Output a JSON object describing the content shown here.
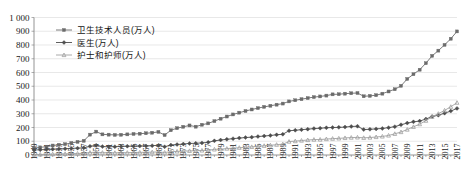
{
  "chart_data": {
    "type": "line",
    "title": "",
    "subtitle": "",
    "xlabel": "",
    "ylabel": "",
    "xlim": [
      1949,
      2017
    ],
    "ylim": [
      0,
      1000
    ],
    "ytick_step": 100,
    "xtick_step": 2,
    "grid": true,
    "legend_position": "top-left",
    "ytick_labels": [
      "0",
      "100",
      "200",
      "300",
      "400",
      "500",
      "600",
      "700",
      "800",
      "900",
      "1 000"
    ],
    "x": [
      1949,
      1950,
      1951,
      1952,
      1953,
      1954,
      1955,
      1956,
      1957,
      1958,
      1959,
      1960,
      1961,
      1962,
      1963,
      1964,
      1965,
      1966,
      1967,
      1968,
      1969,
      1970,
      1971,
      1972,
      1973,
      1974,
      1975,
      1976,
      1977,
      1978,
      1979,
      1980,
      1981,
      1982,
      1983,
      1984,
      1985,
      1986,
      1987,
      1988,
      1989,
      1990,
      1991,
      1992,
      1993,
      1994,
      1995,
      1996,
      1997,
      1998,
      1999,
      2000,
      2001,
      2002,
      2003,
      2004,
      2005,
      2006,
      2007,
      2008,
      2009,
      2010,
      2011,
      2012,
      2013,
      2014,
      2015,
      2016,
      2017
    ],
    "xtick_labels": [
      "1949",
      "1951",
      "1953",
      "1955",
      "1957",
      "1959",
      "1961",
      "1963",
      "1965",
      "1967",
      "1969",
      "1971",
      "1973",
      "1975",
      "1977",
      "1979",
      "1981",
      "1983",
      "1985",
      "1987",
      "1989",
      "1991",
      "1993",
      "1995",
      "1997",
      "1999",
      "2001",
      "2003",
      "2005",
      "2007",
      "2009",
      "2011",
      "2013",
      "2015",
      "2017"
    ],
    "series": [
      {
        "name": "卫生技术人员(万人)",
        "color": "#6b6b6b",
        "marker": "square",
        "values": [
          50.5,
          55.5,
          60.6,
          69.0,
          74.3,
          78.7,
          87.4,
          95.4,
          103.0,
          148.0,
          170.0,
          150.0,
          148.0,
          146.0,
          147.0,
          150.0,
          153.0,
          155.0,
          158.0,
          162.0,
          168.0,
          145.0,
          180.0,
          195.0,
          205.0,
          215.0,
          206.0,
          220.0,
          230.0,
          246.4,
          264.0,
          279.8,
          295.0,
          308.0,
          320.0,
          331.0,
          341.0,
          350.0,
          358.0,
          366.0,
          374.0,
          389.8,
          398.0,
          406.0,
          414.0,
          421.0,
          426.0,
          432.0,
          441.0,
          442.0,
          446.0,
          449.0,
          450.8,
          427.0,
          430.0,
          435.0,
          446.0,
          462.0,
          478.0,
          503.0,
          553.0,
          587.6,
          620.3,
          667.6,
          721.1,
          759.0,
          800.8,
          845.4,
          898.8
        ]
      },
      {
        "name": "医生(万人)",
        "color": "#4d4d4d",
        "marker": "diamond",
        "values": [
          36.3,
          38.0,
          40.0,
          42.5,
          44.0,
          45.8,
          48.0,
          50.0,
          52.0,
          63.0,
          70.0,
          61.0,
          60.0,
          60.5,
          62.0,
          64.0,
          64.0,
          65.0,
          66.0,
          68.0,
          70.0,
          60.0,
          72.0,
          76.0,
          80.0,
          84.0,
          85.0,
          88.0,
          92.0,
          103.0,
          109.0,
          114.0,
          119.0,
          123.0,
          127.0,
          130.0,
          134.1,
          138.0,
          142.0,
          147.0,
          151.0,
          176.3,
          180.0,
          184.0,
          188.0,
          192.0,
          195.0,
          198.0,
          200.0,
          201.0,
          203.0,
          207.6,
          209.0,
          185.0,
          187.0,
          190.0,
          193.0,
          199.0,
          206.0,
          220.0,
          232.0,
          241.3,
          246.6,
          261.6,
          279.5,
          289.3,
          303.9,
          319.1,
          339.0
        ]
      },
      {
        "name": "护士和护师(万人)",
        "color": "#a0a0a0",
        "marker": "triangle",
        "values": [
          3.3,
          3.8,
          4.4,
          6.1,
          7.4,
          8.3,
          9.5,
          10.8,
          12.8,
          18.0,
          21.0,
          17.0,
          16.5,
          16.0,
          16.5,
          17.0,
          18.6,
          19.0,
          20.0,
          21.0,
          22.0,
          18.0,
          24.0,
          26.0,
          28.0,
          30.0,
          31.0,
          33.0,
          35.0,
          40.7,
          43.0,
          46.6,
          49.9,
          53.0,
          56.0,
          59.0,
          63.7,
          67.0,
          71.0,
          75.0,
          79.0,
          97.5,
          101.0,
          105.0,
          109.0,
          112.0,
          112.6,
          116.0,
          119.0,
          121.0,
          124.0,
          126.6,
          128.0,
          125.0,
          127.0,
          130.9,
          134.9,
          142.0,
          154.0,
          167.0,
          185.0,
          204.8,
          224.4,
          249.7,
          278.3,
          300.4,
          324.1,
          350.7,
          380.4
        ]
      }
    ]
  }
}
